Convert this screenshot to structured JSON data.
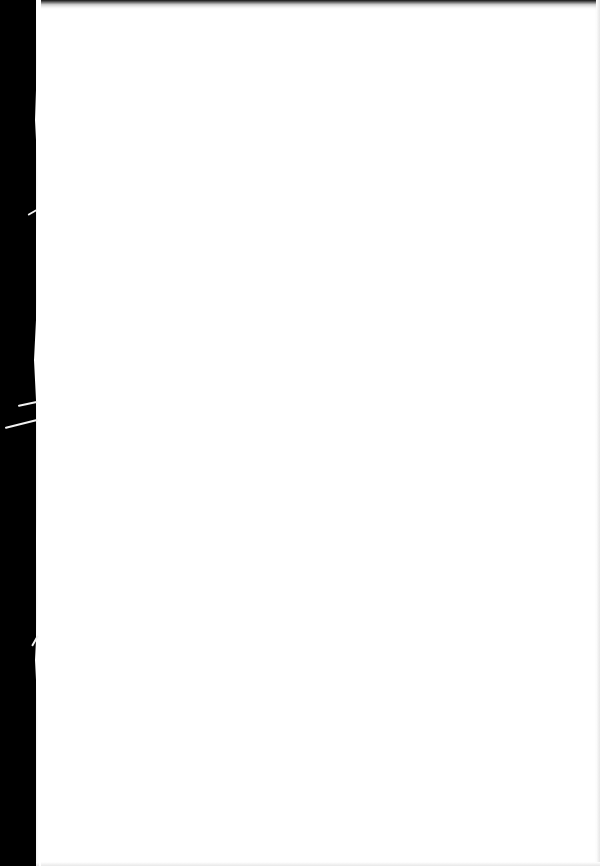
{
  "document": {
    "type": "scanned-page",
    "content": "",
    "colors": {
      "background": "#000000",
      "page": "#ffffff",
      "scratches": "#f2f2f2"
    }
  }
}
